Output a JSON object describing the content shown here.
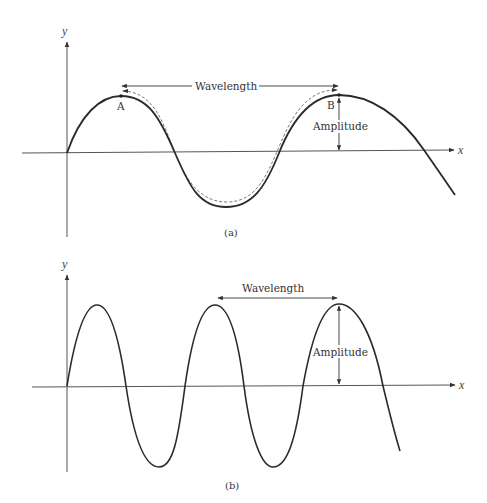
{
  "figure": {
    "panels": [
      {
        "id": "a",
        "caption": "(a)",
        "axes": {
          "x_label": "x",
          "y_label": "y"
        },
        "annotations": {
          "wavelength": "Wavelength",
          "amplitude": "Amplitude",
          "point_a": "A",
          "point_b": "B"
        },
        "description": "Single long-wavelength sine wave; dashed path traces one wavelength from crest A to crest B"
      },
      {
        "id": "b",
        "caption": "(b)",
        "axes": {
          "x_label": "x",
          "y_label": "y"
        },
        "annotations": {
          "wavelength": "Wavelength",
          "amplitude": "Amplitude"
        },
        "description": "Shorter-wavelength sine wave with larger amplitude"
      }
    ],
    "colors": {
      "curve": "#2a2a2a",
      "axis": "#555555",
      "annotation": "#333333",
      "background": "#ffffff"
    }
  }
}
